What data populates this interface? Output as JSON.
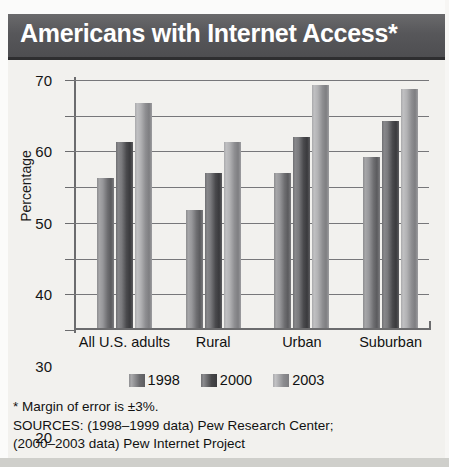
{
  "title": "Americans with Internet Access*",
  "legend": {
    "items": [
      {
        "label": "1998",
        "swatch": "series-1998-swatch"
      },
      {
        "label": "2000",
        "swatch": "series-2000-swatch"
      },
      {
        "label": "2003",
        "swatch": "series-2003-swatch"
      }
    ]
  },
  "notes": {
    "line1": "* Margin of error is ±3%.",
    "line2": "SOURCES: (1998–1999 data) Pew Research Center;",
    "line3": "(2000–2003 data) Pew Internet Project"
  },
  "colors": {
    "title_bar": "#58585a",
    "plot_background": "#f2f1ee",
    "series_1998": "#8a8a8d",
    "series_2000": "#56565a",
    "series_2003": "#a8a8ab",
    "axis": "#6c6c6e",
    "text": "#111111"
  },
  "chart_data": {
    "type": "bar",
    "title": "Americans with Internet Access*",
    "xlabel": "",
    "ylabel": "Percentage",
    "ylim": [
      0,
      70
    ],
    "yticks": [
      0,
      10,
      20,
      30,
      40,
      50,
      60,
      70
    ],
    "ytick_labels": [
      "0",
      "10",
      "20",
      "30",
      "40",
      "50",
      "60",
      "70"
    ],
    "grid": true,
    "legend_position": "bottom-center",
    "categories": [
      "All U.S. adults",
      "Rural",
      "Urban",
      "Suburban"
    ],
    "series": [
      {
        "name": "1998",
        "values": [
          42,
          33,
          43.5,
          48
        ]
      },
      {
        "name": "2000",
        "values": [
          52,
          43.5,
          53.5,
          58
        ]
      },
      {
        "name": "2003",
        "values": [
          63,
          52,
          68,
          67
        ]
      }
    ],
    "annotations": [
      "* Margin of error is ±3%.",
      "SOURCES: (1998–1999 data) Pew Research Center;",
      "(2000–2003 data) Pew Internet Project"
    ]
  }
}
